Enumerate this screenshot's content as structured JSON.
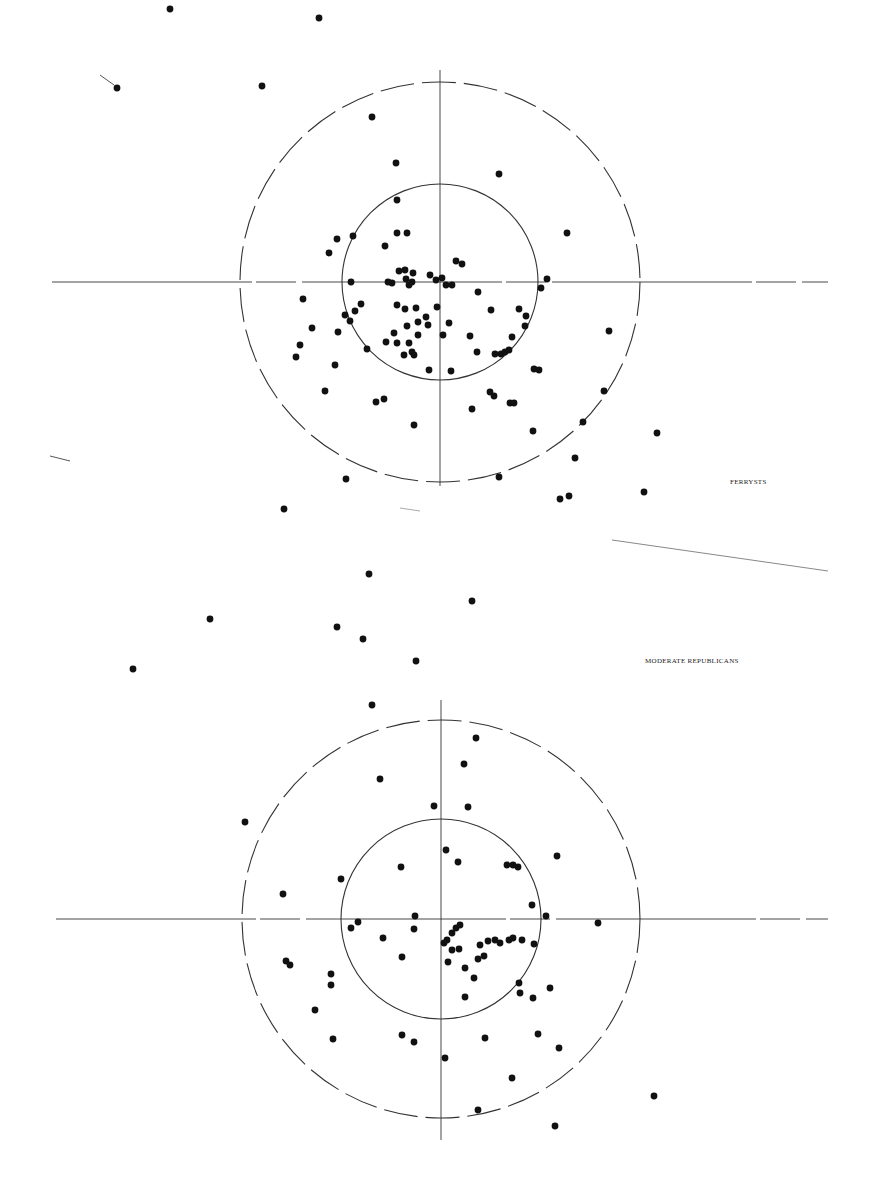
{
  "labels": {
    "panel1": "FERRYSTS",
    "panel2": "MODERATE REPUBLICANS"
  },
  "colors": {
    "ink": "#111111",
    "line": "#333333",
    "background": "#ffffff"
  },
  "chart_data": [
    {
      "type": "scatter",
      "title": "FERRYSTS",
      "center": [
        440,
        282
      ],
      "inner_radius": 98,
      "outer_radius": 200,
      "axis_h": [
        52,
        828
      ],
      "axis_v": [
        70,
        486
      ],
      "points": [
        [
          170,
          9
        ],
        [
          319,
          18
        ],
        [
          117,
          88
        ],
        [
          262,
          86
        ],
        [
          372,
          117
        ],
        [
          396,
          163
        ],
        [
          499,
          174
        ],
        [
          567,
          233
        ],
        [
          397,
          200
        ],
        [
          353,
          236
        ],
        [
          337,
          239
        ],
        [
          329,
          253
        ],
        [
          385,
          246
        ],
        [
          397,
          233
        ],
        [
          407,
          233
        ],
        [
          456,
          261
        ],
        [
          462,
          264
        ],
        [
          399,
          271
        ],
        [
          405,
          270
        ],
        [
          413,
          273
        ],
        [
          406,
          279
        ],
        [
          412,
          282
        ],
        [
          409,
          285
        ],
        [
          430,
          275
        ],
        [
          436,
          280
        ],
        [
          442,
          278
        ],
        [
          446,
          285
        ],
        [
          452,
          285
        ],
        [
          392,
          283
        ],
        [
          388,
          282
        ],
        [
          351,
          282
        ],
        [
          547,
          279
        ],
        [
          541,
          288
        ],
        [
          303,
          299
        ],
        [
          478,
          292
        ],
        [
          491,
          310
        ],
        [
          519,
          309
        ],
        [
          526,
          316
        ],
        [
          361,
          304
        ],
        [
          355,
          311
        ],
        [
          345,
          315
        ],
        [
          350,
          321
        ],
        [
          312,
          328
        ],
        [
          338,
          332
        ],
        [
          300,
          345
        ],
        [
          296,
          357
        ],
        [
          397,
          305
        ],
        [
          405,
          309
        ],
        [
          416,
          308
        ],
        [
          418,
          322
        ],
        [
          407,
          326
        ],
        [
          426,
          317
        ],
        [
          437,
          307
        ],
        [
          394,
          333
        ],
        [
          386,
          342
        ],
        [
          397,
          343
        ],
        [
          409,
          343
        ],
        [
          418,
          335
        ],
        [
          412,
          352
        ],
        [
          414,
          355
        ],
        [
          404,
          355
        ],
        [
          428,
          325
        ],
        [
          449,
          323
        ],
        [
          443,
          335
        ],
        [
          470,
          336
        ],
        [
          477,
          352
        ],
        [
          495,
          354
        ],
        [
          501,
          354
        ],
        [
          505,
          352
        ],
        [
          509,
          350
        ],
        [
          512,
          337
        ],
        [
          525,
          326
        ],
        [
          534,
          369
        ],
        [
          539,
          370
        ],
        [
          367,
          349
        ],
        [
          335,
          365
        ],
        [
          325,
          391
        ],
        [
          376,
          402
        ],
        [
          384,
          399
        ],
        [
          414,
          425
        ],
        [
          429,
          370
        ],
        [
          451,
          371
        ],
        [
          472,
          409
        ],
        [
          490,
          392
        ],
        [
          494,
          396
        ],
        [
          510,
          403
        ],
        [
          514,
          403
        ],
        [
          533,
          431
        ],
        [
          609,
          331
        ],
        [
          604,
          391
        ],
        [
          583,
          422
        ],
        [
          575,
          458
        ],
        [
          657,
          433
        ],
        [
          499,
          477
        ],
        [
          346,
          479
        ],
        [
          284,
          509
        ],
        [
          560,
          499
        ],
        [
          569,
          496
        ],
        [
          644,
          492
        ]
      ]
    },
    {
      "type": "scatter",
      "title": "MODERATE REPUBLICANS",
      "center": [
        441,
        919
      ],
      "inner_radius": 100,
      "outer_radius": 199,
      "axis_h": [
        56,
        828
      ],
      "axis_v": [
        700,
        1140
      ],
      "points": [
        [
          369,
          574
        ],
        [
          472,
          601
        ],
        [
          210,
          619
        ],
        [
          337,
          627
        ],
        [
          363,
          639
        ],
        [
          416,
          661
        ],
        [
          133,
          669
        ],
        [
          372,
          705
        ],
        [
          476,
          738
        ],
        [
          464,
          764
        ],
        [
          380,
          779
        ],
        [
          434,
          806
        ],
        [
          468,
          807
        ],
        [
          245,
          822
        ],
        [
          283,
          894
        ],
        [
          446,
          850
        ],
        [
          458,
          862
        ],
        [
          401,
          867
        ],
        [
          341,
          879
        ],
        [
          507,
          865
        ],
        [
          513,
          865
        ],
        [
          518,
          867
        ],
        [
          557,
          856
        ],
        [
          532,
          905
        ],
        [
          546,
          916
        ],
        [
          598,
          923
        ],
        [
          358,
          922
        ],
        [
          351,
          928
        ],
        [
          415,
          916
        ],
        [
          414,
          929
        ],
        [
          447,
          940
        ],
        [
          456,
          928
        ],
        [
          460,
          925
        ],
        [
          452,
          933
        ],
        [
          383,
          938
        ],
        [
          444,
          943
        ],
        [
          452,
          950
        ],
        [
          459,
          949
        ],
        [
          480,
          945
        ],
        [
          488,
          941
        ],
        [
          495,
          940
        ],
        [
          500,
          943
        ],
        [
          509,
          940
        ],
        [
          513,
          938
        ],
        [
          522,
          940
        ],
        [
          534,
          944
        ],
        [
          448,
          962
        ],
        [
          402,
          957
        ],
        [
          465,
          968
        ],
        [
          478,
          959
        ],
        [
          484,
          956
        ],
        [
          286,
          961
        ],
        [
          290,
          965
        ],
        [
          331,
          974
        ],
        [
          331,
          985
        ],
        [
          474,
          978
        ],
        [
          519,
          983
        ],
        [
          520,
          993
        ],
        [
          550,
          988
        ],
        [
          533,
          998
        ],
        [
          465,
          997
        ],
        [
          315,
          1010
        ],
        [
          402,
          1035
        ],
        [
          414,
          1042
        ],
        [
          445,
          1058
        ],
        [
          485,
          1038
        ],
        [
          538,
          1034
        ],
        [
          559,
          1048
        ],
        [
          333,
          1039
        ],
        [
          512,
          1078
        ],
        [
          478,
          1110
        ],
        [
          555,
          1126
        ],
        [
          654,
          1096
        ]
      ]
    }
  ]
}
